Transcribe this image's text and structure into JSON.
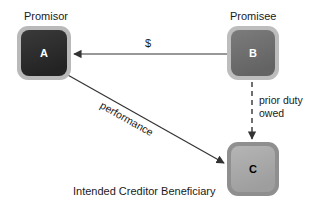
{
  "diagram": {
    "background_color": "#ffffff",
    "caption": "Intended Creditor Beneficiary",
    "nodes": [
      {
        "id": "A",
        "letter": "A",
        "role_label": "Promisor",
        "fill_color": "#2b2b2b",
        "border_color": "#9a9a9a",
        "letter_color": "#ffffff"
      },
      {
        "id": "B",
        "letter": "B",
        "role_label": "Promisee",
        "fill_color": "#6e6e6e",
        "border_color": "#a8a8a8",
        "letter_color": "#ffffff"
      },
      {
        "id": "C",
        "letter": "C",
        "role_label": "",
        "fill_color": "#a9a9a9",
        "border_color": "#8c8c8c",
        "letter_color": "#000000"
      }
    ],
    "edges": [
      {
        "id": "money",
        "label": "$",
        "from": "B",
        "to": "A",
        "style": "solid",
        "color": "#333333"
      },
      {
        "id": "performance",
        "label": "performance",
        "from": "A",
        "to": "C",
        "style": "solid",
        "color": "#333333"
      },
      {
        "id": "prior-duty",
        "label_line1": "prior duty",
        "label_line2": "owed",
        "from": "B",
        "to": "C",
        "style": "dashed",
        "color": "#333333"
      }
    ]
  }
}
